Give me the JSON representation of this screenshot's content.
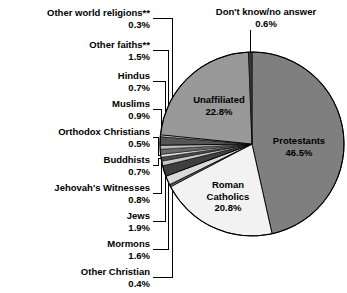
{
  "figure": {
    "background_color": "#ffffff",
    "text_color": "#000000",
    "width": 347,
    "height": 293
  },
  "chart_data": {
    "type": "pie",
    "title": "",
    "subtitle": "",
    "xlabel": "",
    "ylabel": "",
    "units": "percent",
    "total": 100.0,
    "start_angle_deg": 0,
    "direction": "clockwise",
    "legend_position": "none",
    "grid": false,
    "categories": [
      "Protestants",
      "Roman Catholics",
      "Other Christian",
      "Mormons",
      "Jews",
      "Jehovah's Witnesses",
      "Buddhists",
      "Orthodox Christians",
      "Muslims",
      "Hindus",
      "Other faiths**",
      "Other world religions**",
      "Unaffiliated",
      "Don't know/no answer"
    ],
    "values": [
      46.5,
      20.8,
      0.4,
      1.6,
      1.9,
      0.8,
      0.7,
      0.5,
      0.9,
      0.7,
      1.5,
      0.3,
      22.8,
      0.6
    ],
    "value_labels": [
      "46.5%",
      "20.8%",
      "0.4%",
      "1.6%",
      "1.9%",
      "0.8%",
      "0.7%",
      "0.5%",
      "0.9%",
      "0.7%",
      "1.5%",
      "0.3%",
      "22.8%",
      "0.6%"
    ],
    "colors": [
      "#7f7f7f",
      "#f2f2f2",
      "#5a5a5a",
      "#d9d9d9",
      "#3f3f3f",
      "#c8c8c8",
      "#4a4a4a",
      "#e0e0e0",
      "#6b6b6b",
      "#bdbdbd",
      "#555555",
      "#ededed",
      "#999999",
      "#3a3a3a"
    ],
    "slices": [
      {
        "label": "Protestants",
        "value": 46.5,
        "value_label": "46.5%",
        "color": "#7f7f7f",
        "label_placement": "inside"
      },
      {
        "label": "Roman Catholics",
        "value": 20.8,
        "value_label": "20.8%",
        "color": "#f2f2f2",
        "label_placement": "inside"
      },
      {
        "label": "Other Christian",
        "value": 0.4,
        "value_label": "0.4%",
        "color": "#5a5a5a",
        "label_placement": "callout-left"
      },
      {
        "label": "Mormons",
        "value": 1.6,
        "value_label": "1.6%",
        "color": "#d9d9d9",
        "label_placement": "callout-left"
      },
      {
        "label": "Jews",
        "value": 1.9,
        "value_label": "1.9%",
        "color": "#3f3f3f",
        "label_placement": "callout-left"
      },
      {
        "label": "Jehovah's Witnesses",
        "value": 0.8,
        "value_label": "0.8%",
        "color": "#c8c8c8",
        "label_placement": "callout-left"
      },
      {
        "label": "Buddhists",
        "value": 0.7,
        "value_label": "0.7%",
        "color": "#4a4a4a",
        "label_placement": "callout-left"
      },
      {
        "label": "Orthodox Christians",
        "value": 0.5,
        "value_label": "0.5%",
        "color": "#e0e0e0",
        "label_placement": "callout-left"
      },
      {
        "label": "Muslims",
        "value": 0.9,
        "value_label": "0.9%",
        "color": "#6b6b6b",
        "label_placement": "callout-left"
      },
      {
        "label": "Hindus",
        "value": 0.7,
        "value_label": "0.7%",
        "color": "#bdbdbd",
        "label_placement": "callout-left"
      },
      {
        "label": "Other faiths**",
        "value": 1.5,
        "value_label": "1.5%",
        "color": "#555555",
        "label_placement": "callout-left"
      },
      {
        "label": "Other world religions**",
        "value": 0.3,
        "value_label": "0.3%",
        "color": "#ededed",
        "label_placement": "callout-left"
      },
      {
        "label": "Unaffiliated",
        "value": 22.8,
        "value_label": "22.8%",
        "color": "#999999",
        "label_placement": "inside"
      },
      {
        "label": "Don't know/no answer",
        "value": 0.6,
        "value_label": "0.6%",
        "color": "#3a3a3a",
        "label_placement": "callout-top"
      }
    ]
  },
  "inside_labels": {
    "protestants": {
      "name": "Protestants",
      "pct": "46.5%"
    },
    "roman_catholics": {
      "name": "Roman",
      "name2": "Catholics",
      "pct": "20.8%"
    },
    "unaffiliated": {
      "name": "Unaffiliated",
      "pct": "22.8%"
    }
  },
  "callout_top": {
    "name": "Don't know/no answer",
    "pct": "0.6%"
  },
  "callouts_left": [
    {
      "name": "Other world religions**",
      "pct": "0.3%"
    },
    {
      "name": "Other faiths**",
      "pct": "1.5%"
    },
    {
      "name": "Hindus",
      "pct": "0.7%"
    },
    {
      "name": "Muslims",
      "pct": "0.9%"
    },
    {
      "name": "Orthodox Christians",
      "pct": "0.5%"
    },
    {
      "name": "Buddhists",
      "pct": "0.7%"
    },
    {
      "name": "Jehovah's Witnesses",
      "pct": "0.8%"
    },
    {
      "name": "Jews",
      "pct": "1.9%"
    },
    {
      "name": "Mormons",
      "pct": "1.6%"
    },
    {
      "name": "Other Christian",
      "pct": "0.4%"
    }
  ]
}
